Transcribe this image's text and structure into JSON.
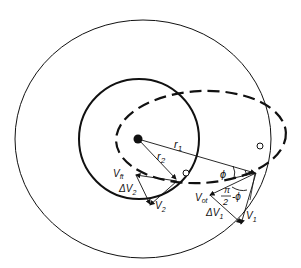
{
  "diagram": {
    "labels": {
      "r1": "r",
      "r1_sub": "1",
      "r2": "r",
      "r2_sub": "2",
      "phi": "ϕ",
      "pi_over_2_num": "π",
      "pi_over_2_den": "2",
      "minus_phi": "-ϕ",
      "vft": "V",
      "vft_sub": "ft",
      "dv2": "ΔV",
      "dv2_sub": "2",
      "v2": "V",
      "v2_sub": "2",
      "vot": "V",
      "vot_sub": "ot",
      "dv1": "ΔV",
      "dv1_sub": "1",
      "v1": "V",
      "v1_sub": "1"
    },
    "colors": {
      "stroke": "#111111",
      "background": "#ffffff"
    }
  }
}
